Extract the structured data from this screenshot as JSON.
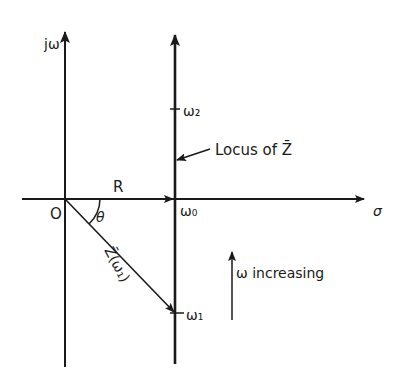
{
  "diagram": {
    "type": "complex-plane impedance locus",
    "colors": {
      "ink": "#1a1a1a",
      "background": "#ffffff"
    },
    "axes": {
      "vertical_label": "jω",
      "horizontal_label": "σ",
      "origin_label": "O"
    },
    "segment_R": {
      "label": "R"
    },
    "angle": {
      "label": "θ"
    },
    "vector": {
      "label": "Z̄(ω₁)"
    },
    "locus": {
      "label": "Locus of Z̄",
      "points": {
        "w0": "ω₀",
        "w1": "ω₁",
        "w2": "ω₂"
      }
    },
    "direction_note": {
      "label": "ω increasing"
    }
  }
}
